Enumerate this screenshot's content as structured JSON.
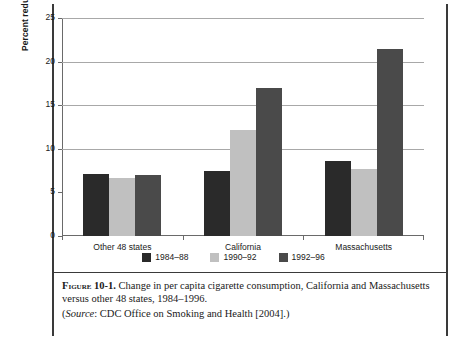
{
  "chart_data": {
    "type": "bar",
    "title": "",
    "xlabel": "",
    "ylabel": "Percent reduction",
    "ylim": [
      0,
      25
    ],
    "yticks": [
      0,
      5,
      10,
      15,
      20,
      25
    ],
    "grid": true,
    "legend_position": "bottom",
    "categories": [
      "Other 48 states",
      "California",
      "Massachusetts"
    ],
    "series": [
      {
        "name": "1984–88",
        "color": "#2a2a2a",
        "values": [
          7.1,
          7.5,
          8.6
        ]
      },
      {
        "name": "1990–92",
        "color": "#c0c0c0",
        "values": [
          6.7,
          12.2,
          7.7
        ]
      },
      {
        "name": "1992–96",
        "color": "#4a4a4a",
        "values": [
          7.0,
          17.0,
          21.5
        ]
      }
    ]
  },
  "caption": {
    "figure_label": "Figure",
    "figure_number": "10-1.",
    "text": "Change in per capita cigarette consumption, California and Massachusetts versus other 48 states, 1984–1996.",
    "source_open": "(",
    "source_word": "Source",
    "source_rest": ": CDC Office on Smoking and Health [2004].)"
  }
}
